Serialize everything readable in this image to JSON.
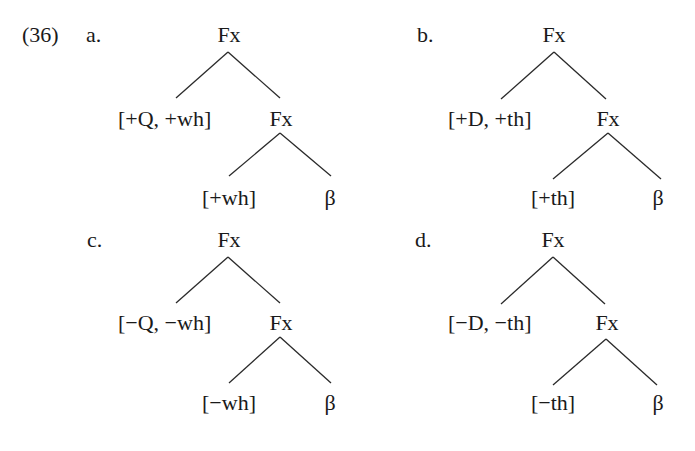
{
  "example_number": "(36)",
  "trees": [
    {
      "label": "a.",
      "root": "Fx",
      "spec": "[+Q, +wh]",
      "mid": "Fx",
      "head": "[+wh]",
      "complement": "β"
    },
    {
      "label": "b.",
      "root": "Fx",
      "spec": "[+D, +th]",
      "mid": "Fx",
      "head": "[+th]",
      "complement": "β"
    },
    {
      "label": "c.",
      "root": "Fx",
      "spec": "[−Q, −wh]",
      "mid": "Fx",
      "head": "[−wh]",
      "complement": "β"
    },
    {
      "label": "d.",
      "root": "Fx",
      "spec": "[−D, −th]",
      "mid": "Fx",
      "head": "[−th]",
      "complement": "β"
    }
  ]
}
